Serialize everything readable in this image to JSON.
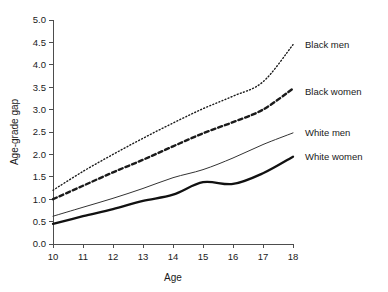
{
  "chart_data": {
    "type": "line",
    "title": "",
    "xlabel": "Age",
    "ylabel": "Age-grade gap",
    "x": [
      10,
      11,
      12,
      13,
      14,
      15,
      16,
      17,
      18
    ],
    "xlim": [
      10,
      18
    ],
    "ylim": [
      0.0,
      5.0
    ],
    "xticks": [
      "10",
      "11",
      "12",
      "13",
      "14",
      "15",
      "16",
      "17",
      "18"
    ],
    "yticks": [
      "0.0",
      "0.5",
      "1.0",
      "1.5",
      "2.0",
      "2.5",
      "3.0",
      "3.5",
      "4.0",
      "4.5",
      "5.0"
    ],
    "grid": false,
    "legend_position": "right-inline",
    "series": [
      {
        "name": "Black men",
        "style": "dotted",
        "color": "#1a1a1a",
        "width": 1.4,
        "values": [
          1.2,
          1.62,
          2.0,
          2.36,
          2.7,
          3.02,
          3.3,
          3.62,
          4.45
        ],
        "label_y": 4.45
      },
      {
        "name": "Black women",
        "style": "dashed",
        "color": "#1a1a1a",
        "width": 2.4,
        "values": [
          1.0,
          1.3,
          1.6,
          1.88,
          2.18,
          2.47,
          2.72,
          3.0,
          3.47
        ],
        "label_y": 3.4
      },
      {
        "name": "White men",
        "style": "solid-thin",
        "color": "#333333",
        "width": 1.0,
        "values": [
          0.62,
          0.82,
          1.02,
          1.24,
          1.48,
          1.66,
          1.92,
          2.22,
          2.48
        ],
        "label_y": 2.48
      },
      {
        "name": "White women",
        "style": "solid-thick",
        "color": "#111111",
        "width": 2.3,
        "values": [
          0.45,
          0.62,
          0.78,
          0.96,
          1.1,
          1.38,
          1.34,
          1.58,
          1.95
        ],
        "label_y": 1.95
      }
    ]
  },
  "legend": {
    "items": [
      {
        "label": "Black men"
      },
      {
        "label": "Black women"
      },
      {
        "label": "White men"
      },
      {
        "label": "White women"
      }
    ]
  },
  "axes": {
    "x_title": "Age",
    "y_title": "Age-grade gap"
  }
}
